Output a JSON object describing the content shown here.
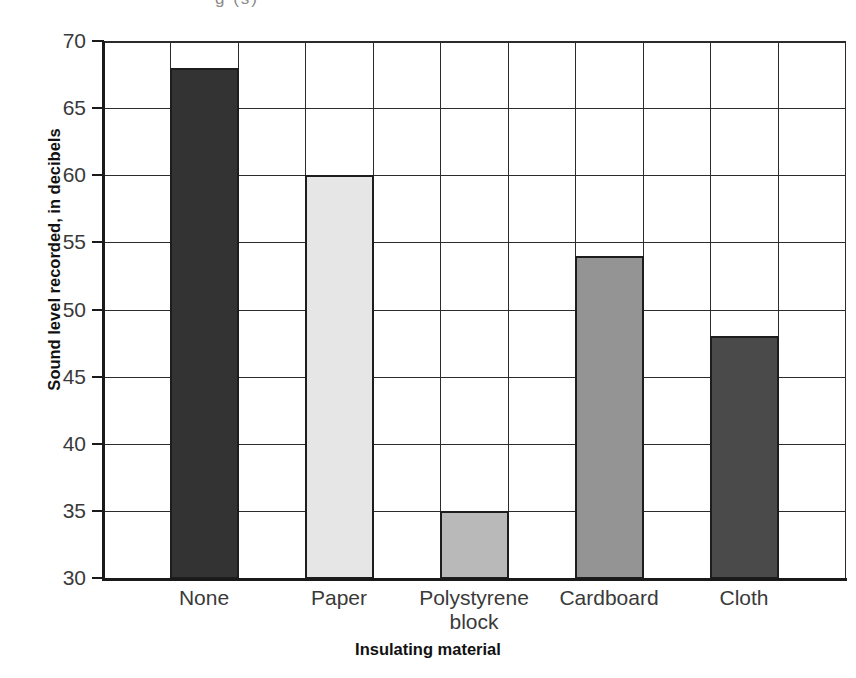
{
  "artifact": {
    "clipped_top_text": "g (s)"
  },
  "chart_data": {
    "type": "bar",
    "title": "",
    "subtitle": "",
    "xlabel": "Insulating material",
    "ylabel": "Sound level recorded, in decibels",
    "categories": [
      "None",
      "Paper",
      "Polystyrene block",
      "Cardboard",
      "Cloth"
    ],
    "category_lines": [
      [
        "None"
      ],
      [
        "Paper"
      ],
      [
        "Polystyrene",
        "block"
      ],
      [
        "Cardboard"
      ],
      [
        "Cloth"
      ]
    ],
    "values": [
      68,
      60,
      35,
      54,
      48
    ],
    "ylim": [
      30,
      70
    ],
    "ytick_step": 5,
    "yticks": [
      30,
      35,
      40,
      45,
      50,
      55,
      60,
      65,
      70
    ],
    "ytick_labels": [
      "30",
      "35",
      "40",
      "45",
      "50",
      "55",
      "60",
      "65",
      "70"
    ],
    "grid": true,
    "legend": "none",
    "bar_colors": [
      "#333333",
      "#e6e6e6",
      "#b9b9b9",
      "#949494",
      "#4a4a4a"
    ],
    "bar_border_color": "#1d1d1d",
    "grid_color": "#2b2b2b",
    "axis_color": "#1a1a1a"
  }
}
